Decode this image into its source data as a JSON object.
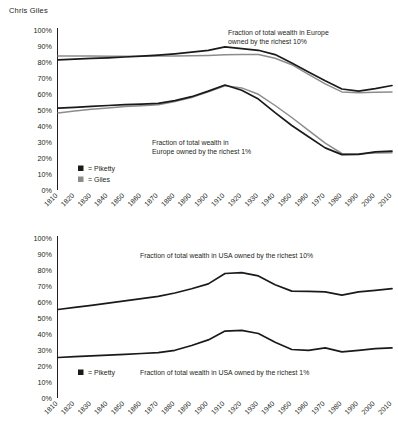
{
  "byline": "Chris Giles",
  "colors": {
    "piketty": "#1a1a1a",
    "giles": "#8c8c8c",
    "axis": "#231f20",
    "text": "#231f20",
    "background": "#ffffff"
  },
  "axis": {
    "y_ticks": [
      "100%",
      "90%",
      "80%",
      "70%",
      "60%",
      "50%",
      "40%",
      "30%",
      "20%",
      "10%",
      "0%"
    ],
    "x_ticks": [
      "1810",
      "1820",
      "1830",
      "1840",
      "1850",
      "1860",
      "1870",
      "1880",
      "1890",
      "1900",
      "1910",
      "1920",
      "1930",
      "1940",
      "1950",
      "1960",
      "1970",
      "1980",
      "1990",
      "2000",
      "2010"
    ]
  },
  "europe": {
    "legend": [
      {
        "label": "= Piketty",
        "swatch": "piketty-swatch",
        "color": "#1a1a1a"
      },
      {
        "label": "= Giles",
        "swatch": "giles-swatch",
        "color": "#8c8c8c"
      }
    ],
    "annotation_top10": "Fraction of total wealth in Europe\nowned by the richest 10%",
    "annotation_top10_line1": "Fraction of total wealth in Europe",
    "annotation_top10_line2": "owned by the richest 10%",
    "annotation_top1_line1": "Fraction of total wealth in",
    "annotation_top1_line2": "Europe owned by the richest 1%"
  },
  "usa": {
    "legend": [
      {
        "label": "= Piketty",
        "swatch": "piketty-swatch",
        "color": "#1a1a1a"
      }
    ],
    "annotation_top10": "Fraction of total wealth in USA owned by the richest 10%",
    "annotation_top1": "Fraction of total wealth in USA owned by the richest 1%"
  },
  "chart_data": [
    {
      "type": "line",
      "title": "Fraction of total wealth in Europe owned by the richest 10% and 1%",
      "xlabel": "",
      "ylabel": "",
      "ylim": [
        0,
        100
      ],
      "y_ticks": [
        0,
        10,
        20,
        30,
        40,
        50,
        60,
        70,
        80,
        90,
        100
      ],
      "grid": false,
      "legend": [
        "Piketty",
        "Giles"
      ],
      "legend_position": "inside-lower-left",
      "x": [
        1810,
        1820,
        1830,
        1840,
        1850,
        1860,
        1870,
        1880,
        1890,
        1900,
        1910,
        1920,
        1930,
        1940,
        1950,
        1960,
        1970,
        1980,
        1990,
        2000,
        2010
      ],
      "series": [
        {
          "name": "Piketty - Europe top 10%",
          "color": "#1a1a1a",
          "values": [
            81.0,
            81.5,
            82.0,
            82.3,
            82.8,
            83.3,
            84.0,
            84.8,
            85.8,
            87.0,
            89.2,
            88.0,
            87.0,
            84.3,
            79.0,
            73.5,
            68.0,
            62.8,
            61.5,
            63.0,
            65.0
          ]
        },
        {
          "name": "Giles - Europe top 10%",
          "color": "#8c8c8c",
          "values": [
            83.5,
            83.5,
            83.4,
            83.3,
            83.3,
            83.3,
            83.4,
            83.5,
            83.6,
            83.8,
            84.2,
            84.3,
            84.3,
            82.0,
            78.0,
            72.0,
            66.0,
            61.0,
            60.5,
            60.8,
            61.0
          ]
        },
        {
          "name": "Piketty - Europe top 1%",
          "color": "#1a1a1a",
          "values": [
            50.8,
            51.3,
            52.0,
            52.5,
            53.0,
            53.3,
            53.8,
            55.5,
            58.0,
            61.5,
            65.3,
            62.0,
            56.5,
            48.0,
            40.0,
            33.0,
            26.0,
            21.8,
            22.0,
            23.5,
            24.0
          ]
        },
        {
          "name": "Giles - Europe top 1%",
          "color": "#8c8c8c",
          "values": [
            47.8,
            49.0,
            50.2,
            51.0,
            51.8,
            52.3,
            53.0,
            55.0,
            57.5,
            61.0,
            64.8,
            63.5,
            59.5,
            52.5,
            45.0,
            37.0,
            29.0,
            22.5,
            22.3,
            22.8,
            23.0
          ]
        }
      ]
    },
    {
      "type": "line",
      "title": "Fraction of total wealth in USA owned by the richest 10% and 1%",
      "xlabel": "",
      "ylabel": "",
      "ylim": [
        0,
        100
      ],
      "y_ticks": [
        0,
        10,
        20,
        30,
        40,
        50,
        60,
        70,
        80,
        90,
        100
      ],
      "grid": false,
      "legend": [
        "Piketty"
      ],
      "legend_position": "inside-lower-left",
      "x": [
        1810,
        1820,
        1830,
        1840,
        1850,
        1860,
        1870,
        1880,
        1890,
        1900,
        1910,
        1920,
        1930,
        1940,
        1950,
        1960,
        1970,
        1980,
        1990,
        2000,
        2010
      ],
      "series": [
        {
          "name": "Piketty - USA top 10%",
          "color": "#1a1a1a",
          "values": [
            55.0,
            56.3,
            57.6,
            59.0,
            60.4,
            61.8,
            63.2,
            65.3,
            68.0,
            71.0,
            77.5,
            78.0,
            76.0,
            70.5,
            66.5,
            66.3,
            66.0,
            64.0,
            66.0,
            67.0,
            68.0
          ]
        },
        {
          "name": "Piketty - USA top 1%",
          "color": "#1a1a1a",
          "values": [
            25.0,
            25.5,
            26.0,
            26.5,
            27.0,
            27.5,
            28.0,
            29.5,
            32.5,
            36.0,
            41.5,
            42.0,
            40.0,
            34.5,
            30.0,
            29.5,
            31.0,
            28.5,
            29.5,
            30.5,
            31.0
          ]
        }
      ]
    }
  ]
}
